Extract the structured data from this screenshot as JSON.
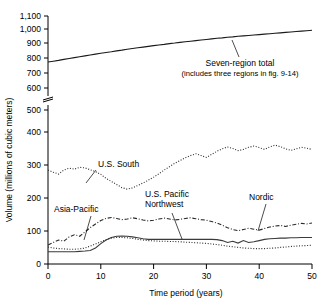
{
  "chart_data": {
    "type": "line",
    "title": "",
    "xlabel": "Time period (years)",
    "ylabel": "Volume (millions of cubic meters)",
    "xlim": [
      0,
      50
    ],
    "ylim": [
      0,
      1100
    ],
    "yticks": [
      "0",
      "100",
      "200",
      "300",
      "400",
      "500",
      "600",
      "700",
      "800",
      "900",
      "1,000",
      "1,100"
    ],
    "xticks": [
      "0",
      "10",
      "20",
      "30",
      "40",
      "50"
    ],
    "grid": false,
    "legend_position": "inline-annotations",
    "axis_break": {
      "between": [
        500,
        600
      ],
      "present": true
    },
    "annotations": [
      {
        "name": "seven-region-total",
        "text": "Seven-region total",
        "subtext": "(includes three regions in fig. 9-14)"
      },
      {
        "name": "us-south",
        "text": "U.S. South"
      },
      {
        "name": "asia-pacific",
        "text": "Asia-Pacific"
      },
      {
        "name": "us-pacific-northwest",
        "text": "U.S. Pacific",
        "text2": "Northwest"
      },
      {
        "name": "nordic",
        "text": "Nordic"
      }
    ],
    "x": [
      0,
      1,
      2,
      3,
      4,
      5,
      6,
      7,
      8,
      9,
      10,
      11,
      12,
      13,
      14,
      15,
      16,
      17,
      18,
      19,
      20,
      21,
      22,
      23,
      24,
      25,
      26,
      27,
      28,
      29,
      30,
      31,
      32,
      33,
      34,
      35,
      36,
      37,
      38,
      39,
      40,
      41,
      42,
      43,
      44,
      45,
      46,
      47,
      48,
      49,
      50
    ],
    "series": [
      {
        "name": "Seven-region total",
        "style": "solid",
        "values": [
          780,
          786,
          792,
          799,
          805,
          811,
          817,
          823,
          829,
          835,
          841,
          847,
          852,
          858,
          863,
          869,
          874,
          879,
          884,
          889,
          894,
          899,
          903,
          908,
          912,
          917,
          921,
          925,
          929,
          933,
          937,
          941,
          945,
          948,
          952,
          955,
          959,
          962,
          965,
          968,
          971,
          974,
          977,
          980,
          983,
          986,
          989,
          992,
          995,
          998,
          1001
        ]
      },
      {
        "name": "U.S. South",
        "style": "dotted",
        "values": [
          305,
          298,
          292,
          305,
          311,
          308,
          314,
          312,
          306,
          300,
          291,
          278,
          268,
          258,
          248,
          243,
          247,
          255,
          263,
          272,
          282,
          293,
          305,
          316,
          327,
          336,
          345,
          352,
          358,
          352,
          346,
          356,
          366,
          374,
          380,
          375,
          368,
          372,
          379,
          383,
          378,
          372,
          380,
          386,
          381,
          374,
          369,
          374,
          379,
          376,
          372
        ]
      },
      {
        "name": "Asia-Pacific",
        "style": "dash-dot",
        "values": [
          62,
          70,
          78,
          74,
          88,
          95,
          90,
          104,
          118,
          130,
          141,
          148,
          151,
          148,
          144,
          146,
          150,
          147,
          143,
          140,
          142,
          146,
          149,
          146,
          143,
          145,
          148,
          150,
          147,
          144,
          142,
          138,
          133,
          126,
          118,
          112,
          108,
          112,
          116,
          113,
          110,
          115,
          120,
          123,
          125,
          122,
          126,
          129,
          132,
          130,
          133
        ]
      },
      {
        "name": "U.S. Pacific Northwest",
        "style": "solid-lower",
        "values": [
          40,
          40,
          40,
          40,
          40,
          40,
          41,
          42,
          44,
          52,
          66,
          78,
          86,
          90,
          91,
          90,
          88,
          85,
          82,
          80,
          80,
          80,
          80,
          80,
          80,
          80,
          80,
          80,
          80,
          80,
          80,
          80,
          79,
          76,
          70,
          74,
          68,
          76,
          70,
          72,
          76,
          80,
          82,
          83,
          84,
          84,
          85,
          85,
          86,
          86,
          86
        ]
      },
      {
        "name": "lower-dotted",
        "style": "dotted-lower",
        "values": [
          55,
          52,
          50,
          49,
          48,
          48,
          49,
          52,
          58,
          65,
          72,
          79,
          84,
          86,
          86,
          85,
          83,
          80,
          78,
          76,
          75,
          74,
          74,
          73,
          73,
          72,
          71,
          70,
          69,
          68,
          67,
          65,
          63,
          61,
          58,
          56,
          54,
          52,
          51,
          50,
          50,
          50,
          51,
          52,
          54,
          55,
          57,
          58,
          59,
          60,
          61
        ]
      }
    ]
  }
}
